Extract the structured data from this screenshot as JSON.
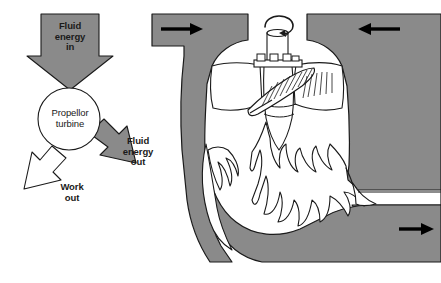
{
  "figure": {
    "background_color": "#ffffff",
    "fill_grey": "#8a8a8a",
    "line_color": "#1a1a1a",
    "white_fill": "#ffffff"
  },
  "block_diagram": {
    "input_arrow_label": "Fluid\nenergy\nin",
    "node_label": "Propellor\nturbine",
    "output_arrow_label": "Fluid\nenergy\nout",
    "work_arrow_label": "Work\nout",
    "input_arrow_color": "#8a8a8a",
    "output_arrow_color": "#8a8a8a",
    "work_arrow_color": "#ffffff",
    "node_shape": "circle"
  },
  "cross_section": {
    "casing_color": "#8a8a8a",
    "inflow_arrow_left_direction": "right",
    "inflow_arrow_right_direction": "left",
    "outflow_arrow_direction": "right",
    "shaft_rotation_direction": "clockwise",
    "blade_hatching": true,
    "draft_tube_flow": "turbulent"
  }
}
